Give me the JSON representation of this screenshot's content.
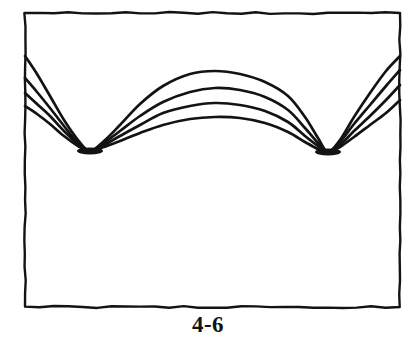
{
  "figure": {
    "caption": "4-6",
    "ink_color": "#131313",
    "background_color": "#ffffff",
    "frame": {
      "name": "figure-border-box",
      "left": 25,
      "top": 13,
      "right": 400,
      "bottom": 307,
      "stroke_width": 2.4
    },
    "nodes": [
      {
        "label": "left-node",
        "x": 90,
        "y": 151
      },
      {
        "label": "right-node",
        "x": 328,
        "y": 152
      }
    ],
    "curve_count": 4
  },
  "chart_data": {
    "type": "line",
    "title": "4-6",
    "subtitle": "",
    "xlabel": "",
    "ylabel": "",
    "grid": false,
    "legend": "none",
    "axis_visible": false,
    "xlim": [
      25,
      400
    ],
    "ylim": [
      307,
      13
    ],
    "note": "Family of four standing-wave / vibrating-string profiles sharing two fixed nodes. Amplitudes are drawn in image pixel coordinates (y increases downward); larger displacement from the node line means larger amplitude.",
    "nodes_x": [
      90,
      328
    ],
    "node_y": 151,
    "series": [
      {
        "name": "amplitude-1-largest",
        "color": "#131313",
        "left_edge_y": 56,
        "central_peak_y": 72,
        "right_edge_y": 56,
        "points": [
          [
            25,
            56
          ],
          [
            37,
            74
          ],
          [
            50,
            96
          ],
          [
            64,
            120
          ],
          [
            78,
            140
          ],
          [
            90,
            151
          ],
          [
            104,
            141
          ],
          [
            120,
            125
          ],
          [
            140,
            104
          ],
          [
            163,
            86
          ],
          [
            190,
            74
          ],
          [
            215,
            71
          ],
          [
            240,
            74
          ],
          [
            265,
            82
          ],
          [
            288,
            96
          ],
          [
            305,
            117
          ],
          [
            318,
            138
          ],
          [
            328,
            152
          ],
          [
            340,
            140
          ],
          [
            354,
            117
          ],
          [
            370,
            93
          ],
          [
            386,
            71
          ],
          [
            400,
            56
          ]
        ]
      },
      {
        "name": "amplitude-2",
        "color": "#131313",
        "left_edge_y": 78,
        "central_peak_y": 88,
        "right_edge_y": 70,
        "points": [
          [
            25,
            78
          ],
          [
            37,
            92
          ],
          [
            50,
            108
          ],
          [
            64,
            126
          ],
          [
            78,
            143
          ],
          [
            90,
            151
          ],
          [
            104,
            143
          ],
          [
            120,
            131
          ],
          [
            140,
            116
          ],
          [
            163,
            102
          ],
          [
            190,
            92
          ],
          [
            215,
            88
          ],
          [
            240,
            90
          ],
          [
            265,
            97
          ],
          [
            288,
            110
          ],
          [
            305,
            128
          ],
          [
            318,
            143
          ],
          [
            328,
            152
          ],
          [
            340,
            142
          ],
          [
            354,
            124
          ],
          [
            370,
            105
          ],
          [
            386,
            86
          ],
          [
            400,
            70
          ]
        ]
      },
      {
        "name": "amplitude-3",
        "color": "#131313",
        "left_edge_y": 93,
        "central_peak_y": 103,
        "right_edge_y": 85,
        "points": [
          [
            25,
            93
          ],
          [
            37,
            104
          ],
          [
            50,
            116
          ],
          [
            64,
            131
          ],
          [
            78,
            144
          ],
          [
            90,
            151
          ],
          [
            104,
            145
          ],
          [
            120,
            136
          ],
          [
            140,
            125
          ],
          [
            163,
            113
          ],
          [
            190,
            106
          ],
          [
            215,
            103
          ],
          [
            240,
            105
          ],
          [
            265,
            111
          ],
          [
            288,
            122
          ],
          [
            305,
            136
          ],
          [
            318,
            146
          ],
          [
            328,
            152
          ],
          [
            340,
            145
          ],
          [
            354,
            131
          ],
          [
            370,
            116
          ],
          [
            386,
            100
          ],
          [
            400,
            85
          ]
        ]
      },
      {
        "name": "amplitude-4-smallest",
        "color": "#131313",
        "left_edge_y": 106,
        "central_peak_y": 117,
        "right_edge_y": 100,
        "points": [
          [
            25,
            106
          ],
          [
            37,
            114
          ],
          [
            50,
            124
          ],
          [
            64,
            136
          ],
          [
            78,
            146
          ],
          [
            90,
            151
          ],
          [
            104,
            147
          ],
          [
            120,
            141
          ],
          [
            140,
            133
          ],
          [
            163,
            125
          ],
          [
            190,
            119
          ],
          [
            215,
            117
          ],
          [
            240,
            118
          ],
          [
            265,
            123
          ],
          [
            288,
            132
          ],
          [
            305,
            142
          ],
          [
            318,
            149
          ],
          [
            328,
            152
          ],
          [
            340,
            147
          ],
          [
            354,
            137
          ],
          [
            370,
            125
          ],
          [
            386,
            113
          ],
          [
            400,
            100
          ]
        ]
      }
    ]
  }
}
